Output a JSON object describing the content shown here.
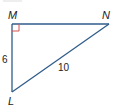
{
  "diagram": {
    "type": "right-triangle",
    "vertices": {
      "M": {
        "label": "M"
      },
      "N": {
        "label": "N"
      },
      "L": {
        "label": "L"
      }
    },
    "right_angle_at": "M",
    "sides": {
      "ML": {
        "label": "6"
      },
      "LN": {
        "label": "10"
      }
    },
    "colors": {
      "line": "#2f5d8a",
      "right_angle_marker": "#d9534f",
      "text": "#222222"
    }
  }
}
